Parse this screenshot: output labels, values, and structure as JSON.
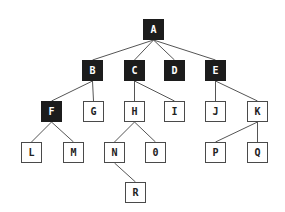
{
  "diagram": {
    "type": "tree",
    "colors": {
      "filled_node": "#1c1c1c",
      "filled_text": "#ffffff",
      "outline_node_border": "#4a4a4a",
      "outline_text": "#222222",
      "edge": "#555555",
      "background": "#ffffff"
    },
    "nodes": [
      {
        "id": "A",
        "label": "A",
        "filled": true,
        "x": 143,
        "y": 19
      },
      {
        "id": "B",
        "label": "B",
        "filled": true,
        "x": 82,
        "y": 60
      },
      {
        "id": "C",
        "label": "C",
        "filled": true,
        "x": 124,
        "y": 60
      },
      {
        "id": "D",
        "label": "D",
        "filled": true,
        "x": 164,
        "y": 60
      },
      {
        "id": "E",
        "label": "E",
        "filled": true,
        "x": 205,
        "y": 60
      },
      {
        "id": "F",
        "label": "F",
        "filled": true,
        "x": 41,
        "y": 101
      },
      {
        "id": "G",
        "label": "G",
        "filled": false,
        "x": 83,
        "y": 101
      },
      {
        "id": "H",
        "label": "H",
        "filled": false,
        "x": 124,
        "y": 101
      },
      {
        "id": "I",
        "label": "I",
        "filled": false,
        "x": 164,
        "y": 101
      },
      {
        "id": "J",
        "label": "J",
        "filled": false,
        "x": 205,
        "y": 101
      },
      {
        "id": "K",
        "label": "K",
        "filled": false,
        "x": 247,
        "y": 101
      },
      {
        "id": "L",
        "label": "L",
        "filled": false,
        "x": 21,
        "y": 142
      },
      {
        "id": "M",
        "label": "M",
        "filled": false,
        "x": 63,
        "y": 142
      },
      {
        "id": "N",
        "label": "N",
        "filled": false,
        "x": 104,
        "y": 142
      },
      {
        "id": "O",
        "label": "0",
        "filled": false,
        "x": 145,
        "y": 142
      },
      {
        "id": "P",
        "label": "P",
        "filled": false,
        "x": 205,
        "y": 142
      },
      {
        "id": "Q",
        "label": "Q",
        "filled": false,
        "x": 247,
        "y": 142
      },
      {
        "id": "R",
        "label": "R",
        "filled": false,
        "x": 125,
        "y": 182
      }
    ],
    "edges": [
      [
        "A",
        "B"
      ],
      [
        "A",
        "C"
      ],
      [
        "A",
        "D"
      ],
      [
        "A",
        "E"
      ],
      [
        "B",
        "F"
      ],
      [
        "B",
        "G"
      ],
      [
        "C",
        "H"
      ],
      [
        "C",
        "I"
      ],
      [
        "E",
        "J"
      ],
      [
        "E",
        "K"
      ],
      [
        "F",
        "L"
      ],
      [
        "F",
        "M"
      ],
      [
        "H",
        "N"
      ],
      [
        "H",
        "O"
      ],
      [
        "K",
        "P"
      ],
      [
        "K",
        "Q"
      ],
      [
        "N",
        "R"
      ]
    ]
  }
}
